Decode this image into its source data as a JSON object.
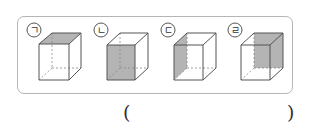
{
  "question": {
    "options": [
      {
        "id": "a",
        "label": "ㄱ",
        "shaded_face": "top"
      },
      {
        "id": "b",
        "label": "ㄴ",
        "shaded_face": "front"
      },
      {
        "id": "c",
        "label": "ㄷ",
        "shaded_face": "left"
      },
      {
        "id": "d",
        "label": "ㄹ",
        "shaded_face": "back"
      }
    ],
    "answer_open": "(",
    "answer_close": ")",
    "answer_value": ""
  },
  "colors": {
    "shade": "#b4b4b4",
    "edge": "#555555",
    "hidden_edge": "#888888",
    "panel_border": "#b5b5b5"
  }
}
